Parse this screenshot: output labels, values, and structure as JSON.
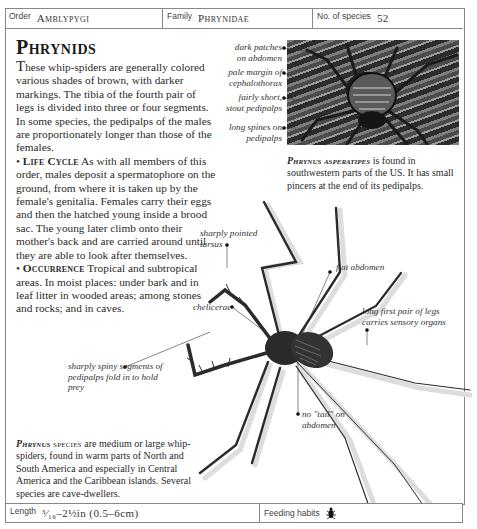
{
  "header": {
    "order_label": "Order",
    "order_value": "Amblypygi",
    "family_label": "Family",
    "family_value": "Phrynidae",
    "species_label": "No. of species",
    "species_value": "52"
  },
  "title": "Phrynids",
  "intro": {
    "dropcap": "T",
    "text": "hese whip-spiders are generally colored various shades of brown, with darker markings. The tibia of the fourth pair of legs is divided into three or four segments. In some species, the pedipalps of the males are proportionately longer than those of the females."
  },
  "sections": [
    {
      "bullet": "•",
      "heading": "Life Cycle",
      "text": "As with all members of this order, males deposit a spermatophore on the ground, from where it is taken up by the female's genitalia. Females carry their eggs and then the hatched young inside a brood sac. The young later climb onto their mother's back and are carried around until they are able to look after themselves."
    },
    {
      "bullet": "•",
      "heading": "Occurrence",
      "text": "Tropical and subtropical areas. In moist places: under bark and in leaf litter in wooded areas; among stones and rocks; and in caves."
    }
  ],
  "photo_annotations": [
    "dark patches on abdomen",
    "pale margin of cephalothorax",
    "fairly short, stout pedipalps",
    "long spines on pedipalps"
  ],
  "photo_caption": {
    "species": "Phrynus asperatipes",
    "text": " is found in southwestern parts of the US. It has small pincers at the end of its pedipalps."
  },
  "illustration_annotations": {
    "tarsus": "sharply pointed tarsus",
    "abdomen": "flat abdomen",
    "chelicerae": "chelicerae",
    "first_legs": "long first pair of legs carries sensory organs",
    "pedipalps": "sharply spiny segments of pedipalps fold in to hold prey",
    "tail": "no \"tail\" on abdomen"
  },
  "illustration_caption": {
    "species": "Phrynus",
    "label": " species",
    "text": " are medium or large whip-spiders, found in warm parts of North and South America and especially in Central America and the Caribbean islands. Several species are cave-dwellers."
  },
  "footer": {
    "length_label": "Length",
    "length_value": "³⁄₁₆–2½in (0.5–6cm)",
    "feeding_label": "Feeding habits",
    "feeding_icon": "insect-icon"
  }
}
